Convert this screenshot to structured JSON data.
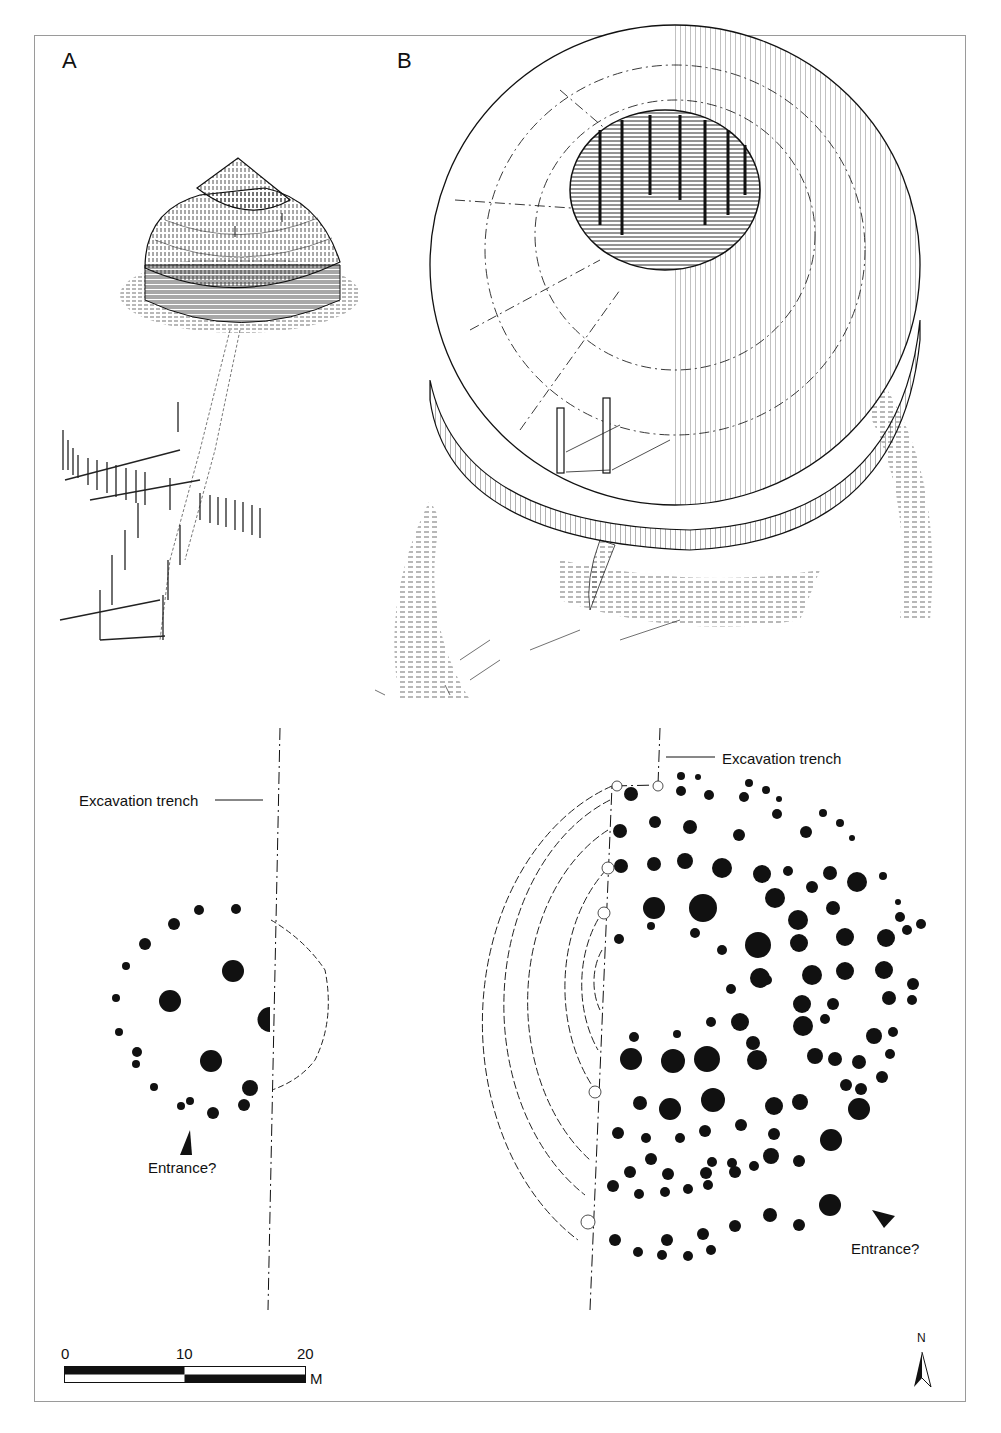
{
  "figure": {
    "panels": [
      {
        "id": "A",
        "label": "A",
        "description": "Reconstruction drawing of a small round building with two-tier conical thatched roof and palisade fence"
      },
      {
        "id": "B",
        "label": "B",
        "description": "Reconstruction drawing of a large ring-shaped building with open central courtyard"
      }
    ],
    "plans": {
      "left": {
        "trench_label": "Excavation trench",
        "entrance_label": "Entrance?"
      },
      "right": {
        "trench_label": "Excavation trench",
        "entrance_label": "Entrance?"
      }
    },
    "scale_bar": {
      "ticks": [
        "0",
        "10",
        "20"
      ],
      "unit": "M"
    },
    "north_arrow": {
      "label": "N"
    },
    "colors": {
      "ink": "#111111",
      "frame": "#9a9a9a",
      "background": "#ffffff"
    }
  }
}
